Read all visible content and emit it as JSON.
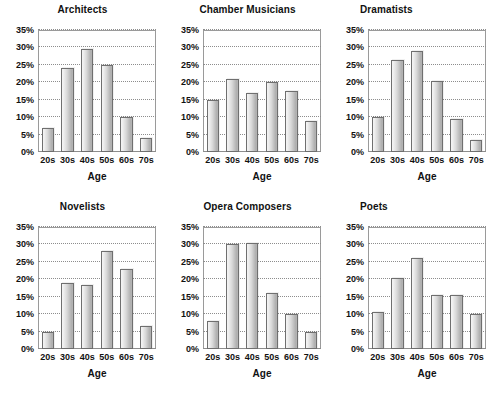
{
  "figure": {
    "background": "#ffffff",
    "bar_fill_light": "#f4f4f4",
    "bar_fill_dark": "#ababab",
    "bar_outline": "#6f6f6f",
    "grid_color": "#8d8d8d",
    "axis_color": "#9a9a9a",
    "rows": 2,
    "cols": 3
  },
  "chart_data": [
    {
      "type": "bar",
      "title": "Architects",
      "categories": [
        "20s",
        "30s",
        "40s",
        "50s",
        "60s",
        "70s"
      ],
      "values": [
        7,
        24,
        29.5,
        25,
        10,
        4
      ],
      "xlabel": "Age",
      "ylabel": "",
      "ylim": [
        0,
        35
      ],
      "ytick_values": [
        0,
        5,
        10,
        15,
        20,
        25,
        30,
        35
      ],
      "ytick_labels": [
        "0%",
        "5%",
        "10%",
        "15%",
        "20%",
        "25%",
        "30%",
        "35%"
      ],
      "grid": true,
      "legend": "none"
    },
    {
      "type": "bar",
      "title": "Chamber Musicians",
      "categories": [
        "20s",
        "30s",
        "40s",
        "50s",
        "60s",
        "70s"
      ],
      "values": [
        15,
        21,
        17,
        20,
        17.5,
        9
      ],
      "xlabel": "Age",
      "ylabel": "",
      "ylim": [
        0,
        35
      ],
      "ytick_values": [
        0,
        5,
        10,
        15,
        20,
        25,
        30,
        35
      ],
      "ytick_labels": [
        "0%",
        "5%",
        "10%",
        "15%",
        "20%",
        "25%",
        "30%",
        "35%"
      ],
      "grid": true,
      "legend": "none"
    },
    {
      "type": "bar",
      "title": "Dramatists",
      "categories": [
        "20s",
        "30s",
        "40s",
        "50s",
        "60s",
        "70s"
      ],
      "values": [
        10,
        26.5,
        29,
        20.5,
        9.5,
        3.5
      ],
      "xlabel": "Age",
      "ylabel": "",
      "ylim": [
        0,
        35
      ],
      "ytick_values": [
        0,
        5,
        10,
        15,
        20,
        25,
        30,
        35
      ],
      "ytick_labels": [
        "0%",
        "5%",
        "10%",
        "15%",
        "20%",
        "25%",
        "30%",
        "35%"
      ],
      "grid": true,
      "legend": "none"
    },
    {
      "type": "bar",
      "title": "Novelists",
      "categories": [
        "20s",
        "30s",
        "40s",
        "50s",
        "60s",
        "70s"
      ],
      "values": [
        5,
        19,
        18.5,
        28,
        23,
        6.5
      ],
      "xlabel": "Age",
      "ylabel": "",
      "ylim": [
        0,
        35
      ],
      "ytick_values": [
        0,
        5,
        10,
        15,
        20,
        25,
        30,
        35
      ],
      "ytick_labels": [
        "0%",
        "5%",
        "10%",
        "15%",
        "20%",
        "25%",
        "30%",
        "35%"
      ],
      "grid": true,
      "legend": "none"
    },
    {
      "type": "bar",
      "title": "Opera Composers",
      "categories": [
        "20s",
        "30s",
        "40s",
        "50s",
        "60s",
        "70s"
      ],
      "values": [
        8,
        30,
        30.5,
        16,
        10,
        5
      ],
      "xlabel": "Age",
      "ylabel": "",
      "ylim": [
        0,
        35
      ],
      "ytick_values": [
        0,
        5,
        10,
        15,
        20,
        25,
        30,
        35
      ],
      "ytick_labels": [
        "0%",
        "5%",
        "10%",
        "15%",
        "20%",
        "25%",
        "30%",
        "35%"
      ],
      "grid": true,
      "legend": "none"
    },
    {
      "type": "bar",
      "title": "Poets",
      "categories": [
        "20s",
        "30s",
        "40s",
        "50s",
        "60s",
        "70s"
      ],
      "values": [
        10.5,
        20.5,
        26,
        15.5,
        15.5,
        10
      ],
      "xlabel": "Age",
      "ylabel": "",
      "ylim": [
        0,
        35
      ],
      "ytick_values": [
        0,
        5,
        10,
        15,
        20,
        25,
        30,
        35
      ],
      "ytick_labels": [
        "0%",
        "5%",
        "10%",
        "15%",
        "20%",
        "25%",
        "30%",
        "35%"
      ],
      "grid": true,
      "legend": "none"
    }
  ]
}
